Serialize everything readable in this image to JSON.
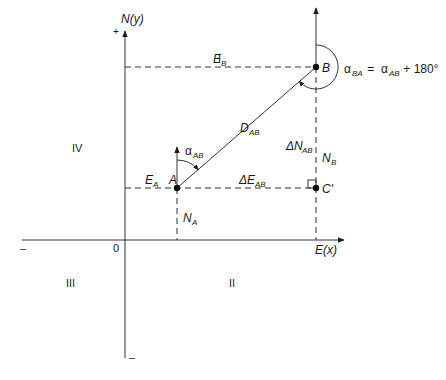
{
  "diagram": {
    "axes": {
      "y_label": "N(y)",
      "x_label": "E(x)",
      "origin": "0",
      "y_plus": "+",
      "y_minus": "–",
      "x_minus": "–"
    },
    "quadrants": {
      "q1": "I",
      "q2": "II",
      "q3": "III",
      "q4": "IV"
    },
    "points": {
      "a": "A",
      "b": "B",
      "c": "C′"
    },
    "labels": {
      "e_b": {
        "main": "E",
        "sub": "B"
      },
      "e_a": {
        "main": "E",
        "sub": "A"
      },
      "n_a": {
        "main": "N",
        "sub": "A"
      },
      "n_b": {
        "main": "N",
        "sub": "B"
      },
      "d_ab": {
        "main": "D",
        "sub": "AB"
      },
      "delta_e_ab": {
        "main": "ΔE",
        "sub": "AB"
      },
      "delta_n_ab": {
        "main": "ΔN",
        "sub": "AB"
      },
      "alpha_ab": {
        "main": "α",
        "sub": "AB"
      },
      "alpha_ba_eq": {
        "lhs_main": "α",
        "lhs_sub": "BA",
        "eq": " = ",
        "rhs_main": "α",
        "rhs_sub": "AB",
        "rhs_tail": " + 180°"
      }
    },
    "colors": {
      "ink": "#1a1a1a",
      "background": "#ffffff"
    }
  }
}
